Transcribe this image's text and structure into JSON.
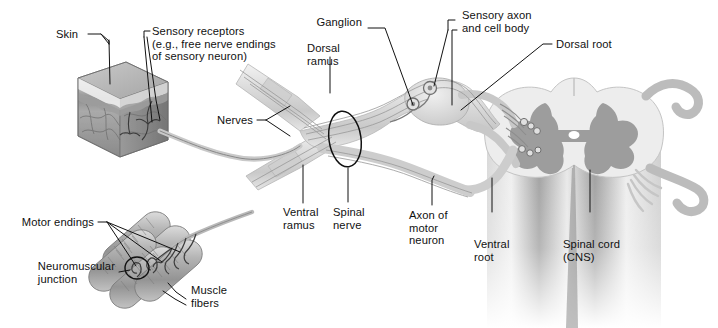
{
  "figure": {
    "background_color": "#ffffff",
    "line_color": "#111111",
    "nerve_fill": "#d8d8d8",
    "nerve_stroke": "#9a9a9a",
    "gray_matter_color": "#9d9d9d",
    "white_matter_color": "#e3e3e3",
    "skin_color": "#b8b8b8",
    "muscle_color": "#b0b0b0"
  },
  "labels": {
    "skin": "Skin",
    "sensory_receptors": "Sensory receptors\n(e.g., free nerve endings\nof sensory neuron)",
    "dorsal_ramus": "Dorsal\nramus",
    "ganglion": "Ganglion",
    "sensory_axon": "Sensory axon\nand cell body",
    "dorsal_root": "Dorsal root",
    "nerves": "Nerves",
    "ventral_ramus": "Ventral\nramus",
    "spinal_nerve": "Spinal\nnerve",
    "axon_of_motor_neuron": "Axon of\nmotor\nneuron",
    "ventral_root": "Ventral\nroot",
    "spinal_cord": "Spinal cord\n(CNS)",
    "motor_endings": "Motor endings",
    "neuromuscular_junction": "Neuromuscular\njunction",
    "muscle_fibers": "Muscle\nfibers"
  },
  "structures": {
    "skin_block": "skin-block",
    "muscle_bundle": "muscle-fiber-bundle",
    "spinal_cord_section": "spinal-cord-cross-section",
    "ganglion_bulge": "dorsal-root-ganglion",
    "spinal_nerve_marker": "spinal-nerve-ellipse",
    "central_canal": "central-canal"
  }
}
